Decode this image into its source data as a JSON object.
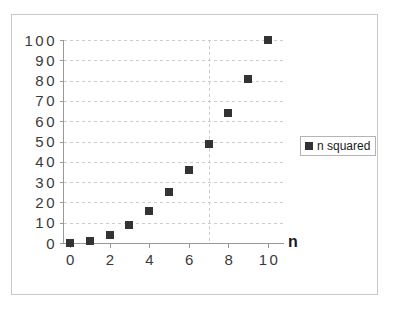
{
  "chart_data": {
    "type": "scatter",
    "title": "",
    "xlabel": "n",
    "ylabel": "",
    "x": [
      0,
      1,
      2,
      3,
      4,
      5,
      6,
      7,
      8,
      9,
      10
    ],
    "values": [
      0,
      1,
      4,
      9,
      16,
      25,
      36,
      49,
      64,
      81,
      100
    ],
    "series": [
      {
        "name": "n squared",
        "values": [
          0,
          1,
          4,
          9,
          16,
          25,
          36,
          49,
          64,
          81,
          100
        ]
      }
    ],
    "xlim": [
      0,
      10
    ],
    "ylim": [
      0,
      100
    ],
    "x_tick_labels": [
      "0",
      "2",
      "4",
      "6",
      "8",
      "10"
    ],
    "x_tick_values": [
      0,
      2,
      4,
      6,
      8,
      10
    ],
    "y_tick_labels": [
      "0",
      "10",
      "20",
      "30",
      "40",
      "50",
      "60",
      "70",
      "80",
      "90",
      "100"
    ],
    "y_tick_values": [
      0,
      10,
      20,
      30,
      40,
      50,
      60,
      70,
      80,
      90,
      100
    ],
    "grid": true,
    "grid_style": "dashed",
    "legend_position": "right",
    "legend_entries": [
      "n squared"
    ],
    "marker": "square",
    "marker_color": "#333333",
    "grid_color": "#cccccc",
    "axis_color": "#999999",
    "frame_color": "#c8c8c8"
  },
  "legend": {
    "label": "n squared",
    "swatch_name": "series-marker-swatch"
  },
  "axes": {
    "x_title": "n"
  }
}
